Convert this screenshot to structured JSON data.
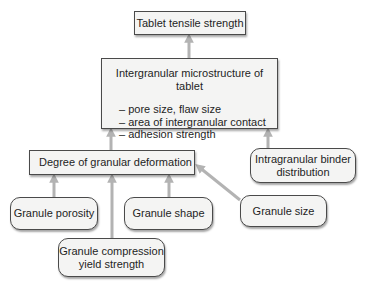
{
  "diagram": {
    "nodes": {
      "tablet_tensile_strength": {
        "label": "Tablet tensile strength"
      },
      "intergranular_microstructure": {
        "label": "Intergranular microstructure of tablet",
        "bullets": [
          "– pore size, flaw size",
          "– area of intergranular contact",
          "– adhesion strength"
        ]
      },
      "degree_of_granular_deformation": {
        "label": "Degree of granular deformation"
      },
      "intragranular_binder_distribution": {
        "lines": [
          "Intragranular binder",
          "distribution"
        ]
      },
      "granule_porosity": {
        "label": "Granule porosity"
      },
      "granule_shape": {
        "label": "Granule shape"
      },
      "granule_size": {
        "label": "Granule size"
      },
      "granule_compression_yield_strength": {
        "lines": [
          "Granule compression",
          "yield strength"
        ]
      }
    },
    "edges": [
      {
        "from": "intergranular_microstructure",
        "to": "tablet_tensile_strength"
      },
      {
        "from": "degree_of_granular_deformation",
        "to": "intergranular_microstructure"
      },
      {
        "from": "intragranular_binder_distribution",
        "to": "intergranular_microstructure"
      },
      {
        "from": "granule_porosity",
        "to": "degree_of_granular_deformation"
      },
      {
        "from": "granule_compression_yield_strength",
        "to": "degree_of_granular_deformation"
      },
      {
        "from": "granule_shape",
        "to": "degree_of_granular_deformation"
      },
      {
        "from": "granule_size",
        "to": "degree_of_granular_deformation"
      }
    ],
    "colors": {
      "arrow": "#b3b3b3",
      "box_fill": "#f4f4f3",
      "box_border": "#4a4a4a"
    }
  }
}
